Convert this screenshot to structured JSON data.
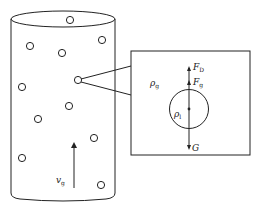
{
  "diagram": {
    "type": "gas-liquid bubble column force diagram",
    "colors": {
      "stroke": "#222222",
      "background": "#ffffff"
    },
    "column": {
      "label": "v",
      "label_sub": "g",
      "description": "Cylindrical column with dispersed bubbles and upward velocity arrow"
    },
    "inset": {
      "gas_density_label": "ρ",
      "gas_density_sub": "g",
      "liquid_density_label": "ρ",
      "liquid_density_sub": "l",
      "forces": [
        {
          "name": "drag",
          "label": "F",
          "sub": "D",
          "direction": "up"
        },
        {
          "name": "buoyancy",
          "label": "F",
          "sub": "g",
          "direction": "up"
        },
        {
          "name": "gravity",
          "label": "G",
          "sub": "",
          "direction": "down"
        }
      ]
    }
  }
}
